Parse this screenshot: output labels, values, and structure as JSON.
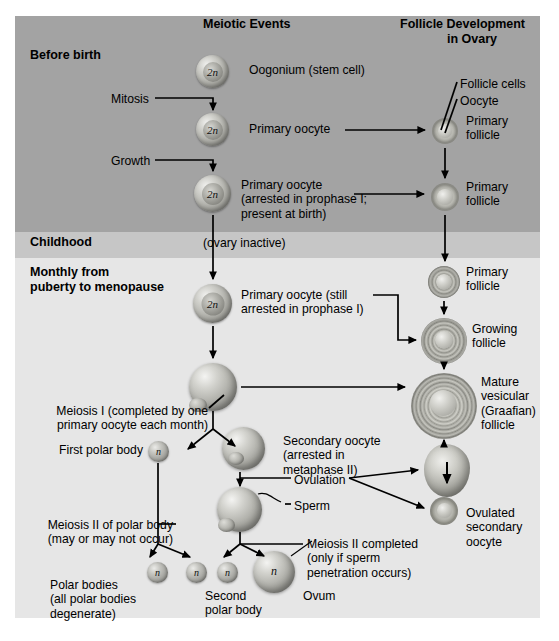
{
  "headers": {
    "meiotic": "Meiotic Events",
    "follicle_line1": "Follicle Development",
    "follicle_line2": "in Ovary"
  },
  "stages": [
    {
      "label": "Before birth"
    },
    {
      "label": "Childhood"
    },
    {
      "label": "Monthly from\npuberty to menopause"
    }
  ],
  "meiotic_labels": {
    "oogonium": "Oogonium (stem cell)",
    "mitosis": "Mitosis",
    "primary_oocyte": "Primary oocyte",
    "growth": "Growth",
    "primary_oocyte_arrested": "Primary oocyte\n(arrested in prophase I;\npresent at birth)",
    "ovary_inactive": "(ovary inactive)",
    "primary_oocyte_still": "Primary oocyte (still\narrested in prophase I)",
    "meiosis_i": "Meiosis I (completed by one\nprimary oocyte each month)",
    "first_polar_body": "First polar body",
    "secondary_oocyte": "Secondary oocyte\n(arrested in\nmetaphase II)",
    "ovulation": "Ovulation",
    "sperm": "Sperm",
    "meiosis_ii_polar": "Meiosis II of polar body\n(may or may not occur)",
    "meiosis_ii_completed": "Meiosis II completed\n(only if sperm\npenetration occurs)",
    "polar_bodies": "Polar bodies\n(all polar bodies\ndegenerate)",
    "second_polar_body": "Second\npolar body",
    "ovum": "Ovum"
  },
  "follicle_labels": {
    "follicle_cells": "Follicle cells",
    "oocyte": "Oocyte",
    "primary_follicle_1": "Primary\nfollicle",
    "primary_follicle_2": "Primary\nfollicle",
    "primary_follicle_3": "Primary\nfollicle",
    "growing_follicle": "Growing\nfollicle",
    "mature_follicle": "Mature\nvesicular\n(Graafian)\nfollicle",
    "ovulated_secondary_oocyte": "Ovulated\nsecondary\noocyte"
  },
  "cell_ploidy": {
    "diploid": "2n",
    "haploid": "n"
  },
  "colors": {
    "band_before_birth": "#a3a3a3",
    "band_childhood": "#c6c6c6",
    "band_monthly": "#e6e6e6",
    "text": "#000000",
    "arrow": "#000000"
  }
}
